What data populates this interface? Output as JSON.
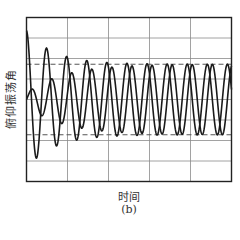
{
  "chart_data": {
    "type": "line",
    "title": "",
    "subfigure_label": "(b)",
    "xlabel": "时间",
    "ylabel": "俯仰振荡角",
    "x_tick_labels": [],
    "y_tick_labels": [],
    "grid": true,
    "grid_columns": 5,
    "grid_rows": 8,
    "xlim": [
      0,
      10
    ],
    "ylim": [
      -1,
      1
    ],
    "reference_lines": [
      {
        "style": "dashed",
        "y": 0.43,
        "label": "limit-cycle upper bound"
      },
      {
        "style": "dashed",
        "y": -0.43,
        "label": "limit-cycle lower bound"
      }
    ],
    "legend": null,
    "series": [
      {
        "name": "curve-1",
        "description": "starts near top, large decaying oscillation converging to steady limit cycle",
        "initial_amplitude": 0.84,
        "steady_amplitude": 0.43,
        "period": 0.98,
        "phase": 1.5708,
        "decay": 0.75
      },
      {
        "name": "curve-2",
        "description": "starts near zero, growing oscillation converging to same steady limit cycle",
        "initial_amplitude": 0.08,
        "steady_amplitude": 0.43,
        "period": 0.98,
        "phase": 0.0,
        "growth": 0.55
      }
    ]
  },
  "colors": {
    "curve": "#1a1a1a",
    "grid": "#8a8a8a",
    "dashed": "#555555",
    "frame": "#222222"
  }
}
